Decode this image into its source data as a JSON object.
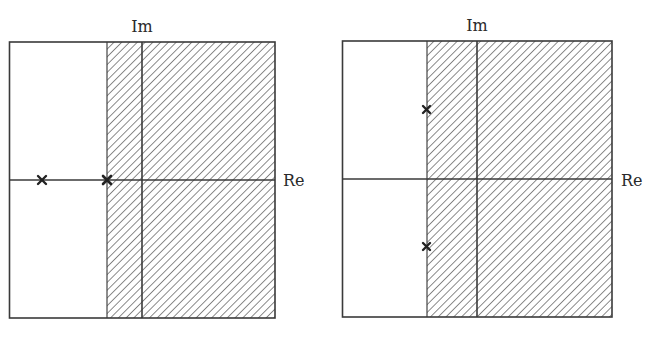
{
  "diagram": {
    "type": "complex-plane pole-zero plots",
    "line_color": "#3a3a3a",
    "hatch_color": "#5a5a5a",
    "panels": [
      {
        "id": "left",
        "axis_labels": {
          "imag": "Im",
          "real": "Re"
        },
        "region_shaded": "right of vertical boundary (hatched stability region)",
        "poles": [
          {
            "marker": "×",
            "location": "on real axis, far left"
          },
          {
            "marker": "×",
            "location": "on real axis, at boundary of hatched region"
          }
        ]
      },
      {
        "id": "right",
        "axis_labels": {
          "imag": "Im",
          "real": "Re"
        },
        "region_shaded": "right of vertical boundary (hatched stability region)",
        "poles": [
          {
            "marker": "×",
            "location": "upper half-plane, on boundary"
          },
          {
            "marker": "×",
            "location": "lower half-plane, on boundary"
          }
        ]
      }
    ]
  }
}
